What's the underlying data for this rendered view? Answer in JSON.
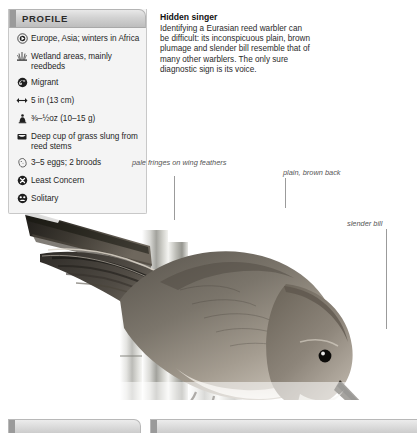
{
  "profile": {
    "title": "PROFILE",
    "rows": [
      {
        "icon": "globe-range-icon",
        "text": "Europe, Asia; winters in Africa"
      },
      {
        "icon": "reeds-habitat-icon",
        "text": "Wetland areas, mainly reedbeds"
      },
      {
        "icon": "migration-arrow-icon",
        "text": "Migrant"
      },
      {
        "icon": "length-arrows-icon",
        "text": "5 in (13 cm)"
      },
      {
        "icon": "weight-icon",
        "text": "⅜–½oz (10–15 g)"
      },
      {
        "icon": "nest-icon",
        "text": "Deep cup of grass slung from reed stems"
      },
      {
        "icon": "egg-icon",
        "text": "3–5 eggs; 2 broods"
      },
      {
        "icon": "conservation-status-icon",
        "text": "Least Concern"
      },
      {
        "icon": "social-behavior-icon",
        "text": "Solitary"
      }
    ]
  },
  "description": {
    "heading": "Hidden singer",
    "body": "Identifying a Eurasian reed warbler can be difficult: its inconspicuous plain, brown plumage and slender bill resemble that of many other warblers. The only sure diagnostic sign is its voice."
  },
  "callouts": [
    {
      "id": "wing",
      "text": "pale fringes on wing feathers"
    },
    {
      "id": "back",
      "text": "plain, brown back"
    },
    {
      "id": "bill",
      "text": "slender bill"
    }
  ],
  "colors": {
    "panel_background": "#f4f4f4",
    "panel_border": "#c8c8c8",
    "header_accent": "#9a9a9a",
    "leader_line": "#9b9b9b",
    "callout_text": "#555555"
  }
}
